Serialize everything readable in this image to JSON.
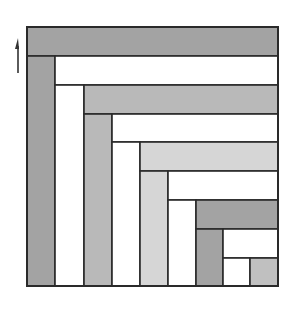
{
  "diagram": {
    "title": "",
    "colors": {
      "dark": "#a3a3a3",
      "medium": "#b9b9b9",
      "light": "#d6d6d6",
      "square": "#c0c0c0",
      "white": "#ffffff",
      "stroke": "#2a2a2a",
      "arrow": "#333333"
    },
    "arrow": {
      "direction": "up",
      "x": 18,
      "y_top": 38,
      "y_bottom": 73
    },
    "outer": {
      "x": 27,
      "y": 27,
      "w": 251,
      "h": 259
    },
    "blocks": [
      {
        "id": "bar-1",
        "orientation": "horizontal",
        "x": 27,
        "y": 27,
        "w": 251,
        "h": 29,
        "fill": "dark"
      },
      {
        "id": "col-1",
        "orientation": "vertical",
        "x": 27,
        "y": 56,
        "w": 28,
        "h": 230,
        "fill": "dark"
      },
      {
        "id": "bar-2",
        "orientation": "horizontal",
        "x": 55,
        "y": 56,
        "w": 223,
        "h": 29,
        "fill": "white"
      },
      {
        "id": "col-2",
        "orientation": "vertical",
        "x": 55,
        "y": 85,
        "w": 29,
        "h": 201,
        "fill": "white"
      },
      {
        "id": "bar-3",
        "orientation": "horizontal",
        "x": 84,
        "y": 85,
        "w": 194,
        "h": 29,
        "fill": "medium"
      },
      {
        "id": "col-3",
        "orientation": "vertical",
        "x": 84,
        "y": 114,
        "w": 28,
        "h": 172,
        "fill": "medium"
      },
      {
        "id": "bar-4",
        "orientation": "horizontal",
        "x": 112,
        "y": 114,
        "w": 166,
        "h": 28,
        "fill": "white"
      },
      {
        "id": "col-4",
        "orientation": "vertical",
        "x": 112,
        "y": 142,
        "w": 28,
        "h": 144,
        "fill": "white"
      },
      {
        "id": "bar-5",
        "orientation": "horizontal",
        "x": 140,
        "y": 142,
        "w": 138,
        "h": 29,
        "fill": "light"
      },
      {
        "id": "col-5",
        "orientation": "vertical",
        "x": 140,
        "y": 171,
        "w": 28,
        "h": 115,
        "fill": "light"
      },
      {
        "id": "bar-6",
        "orientation": "horizontal",
        "x": 168,
        "y": 171,
        "w": 110,
        "h": 29,
        "fill": "white"
      },
      {
        "id": "col-6",
        "orientation": "vertical",
        "x": 168,
        "y": 200,
        "w": 28,
        "h": 86,
        "fill": "white"
      },
      {
        "id": "bar-7",
        "orientation": "horizontal",
        "x": 196,
        "y": 200,
        "w": 82,
        "h": 29,
        "fill": "dark"
      },
      {
        "id": "col-7",
        "orientation": "vertical",
        "x": 196,
        "y": 229,
        "w": 27,
        "h": 57,
        "fill": "dark"
      },
      {
        "id": "bar-8",
        "orientation": "horizontal",
        "x": 223,
        "y": 229,
        "w": 55,
        "h": 29,
        "fill": "white"
      },
      {
        "id": "col-8",
        "orientation": "vertical",
        "x": 223,
        "y": 258,
        "w": 27,
        "h": 28,
        "fill": "white"
      },
      {
        "id": "square",
        "orientation": "square",
        "x": 250,
        "y": 258,
        "w": 28,
        "h": 28,
        "fill": "square"
      }
    ]
  }
}
